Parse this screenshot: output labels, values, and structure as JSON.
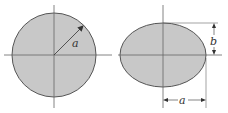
{
  "figures": [
    {
      "shape": "circle",
      "dimension_labels": [
        "a"
      ],
      "description": "Circle of radius a with centroidal axes"
    },
    {
      "shape": "ellipse",
      "dimension_labels": [
        "a",
        "b"
      ],
      "description": "Ellipse with semi-axes a (horizontal) and b (vertical) with centroidal axes"
    }
  ],
  "labels": {
    "circle_radius": "a",
    "ellipse_semi_major": "a",
    "ellipse_semi_minor": "b"
  },
  "colors": {
    "fill": "#c8c8c8",
    "stroke": "#555555",
    "axis": "#666666"
  }
}
